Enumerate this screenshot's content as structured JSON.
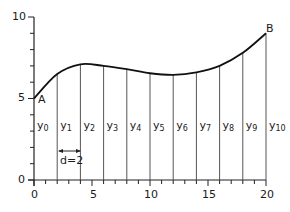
{
  "chart_data": {
    "type": "line",
    "title": "",
    "xlabel": "",
    "ylabel": "",
    "xlim": [
      0,
      20
    ],
    "ylim": [
      0,
      10
    ],
    "x_ticks": [
      "0",
      "5",
      "10",
      "15",
      "20"
    ],
    "y_ticks": [
      "0",
      "5",
      "10"
    ],
    "grid": false,
    "x": [
      0,
      2,
      4,
      6,
      8,
      10,
      12,
      14,
      16,
      18,
      20
    ],
    "series": [
      {
        "name": "curve AB",
        "values": [
          5.0,
          6.5,
          7.1,
          7.0,
          6.8,
          6.55,
          6.45,
          6.6,
          7.0,
          7.8,
          9.0
        ]
      }
    ],
    "ordinates": [
      "y0",
      "y1",
      "y2",
      "y3",
      "y4",
      "y5",
      "y6",
      "y7",
      "y8",
      "y9",
      "y10"
    ],
    "annotations": [
      {
        "text": "A",
        "at": [
          0,
          5
        ]
      },
      {
        "text": "B",
        "at": [
          20,
          9
        ]
      },
      {
        "text": "d=2",
        "spans": [
          2,
          4
        ]
      }
    ]
  },
  "labels": {
    "point_a": "A",
    "point_b": "B",
    "interval": "d=2",
    "y_tick_0": "0",
    "y_tick_5": "5",
    "y_tick_10": "10",
    "x_tick_0": "0",
    "x_tick_5": "5",
    "x_tick_10": "10",
    "x_tick_15": "15",
    "x_tick_20": "20",
    "ordinate_letter": "y",
    "ordinate_subs": [
      "0",
      "1",
      "2",
      "3",
      "4",
      "5",
      "6",
      "7",
      "8",
      "9",
      "10"
    ]
  },
  "colors": {
    "curve": "#111111",
    "axis": "#222222",
    "ordinate_line": "#555555"
  }
}
